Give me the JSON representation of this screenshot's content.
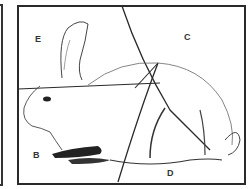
{
  "figure": {
    "regions": [
      {
        "id": "E",
        "label": "E"
      },
      {
        "id": "C",
        "label": "C"
      },
      {
        "id": "B",
        "label": "B"
      },
      {
        "id": "D",
        "label": "D"
      }
    ],
    "colors": {
      "line": "#2a2a2a",
      "background": "#ffffff"
    }
  }
}
